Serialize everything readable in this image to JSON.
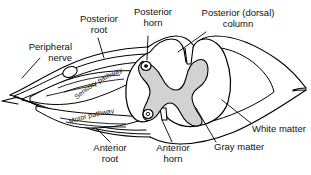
{
  "figure": {
    "colors": {
      "outline": "#000000",
      "gray_matter": "#d2d2d2",
      "white_matter": "#ffffff",
      "background": "#ffffff",
      "text": "#111111"
    }
  },
  "labels": {
    "peripheral_nerve": {
      "line1": "Peripheral",
      "line2": "nerve"
    },
    "posterior_root": {
      "line1": "Posterior",
      "line2": "root"
    },
    "posterior_horn": {
      "line1": "Posterior",
      "line2": "horn"
    },
    "posterior_column": {
      "line1": "Posterior (dorsal)",
      "line2": "column"
    },
    "white_matter": {
      "line1": "White matter"
    },
    "gray_matter": {
      "line1": "Gray matter"
    },
    "anterior_horn": {
      "line1": "Anterior",
      "line2": "horn"
    },
    "anterior_root": {
      "line1": "Anterior",
      "line2": "root"
    },
    "sensory_pathway": {
      "line1": "Sensory pathway"
    },
    "motor_pathway": {
      "line1": "Motor pathway"
    }
  }
}
